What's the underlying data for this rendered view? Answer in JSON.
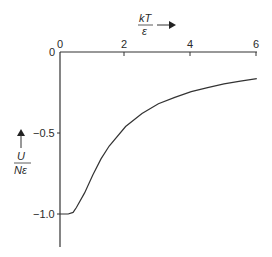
{
  "chart_data": {
    "type": "line",
    "title": "",
    "xlabel": "kT/ε",
    "ylabel": "U/Nε",
    "xlabel_num": "kT",
    "xlabel_den": "ε",
    "ylabel_num": "U",
    "ylabel_den": "Nε",
    "xlim": [
      0,
      6
    ],
    "ylim": [
      -1.2,
      0
    ],
    "x_ticks": [
      "0",
      "2",
      "4",
      "6"
    ],
    "y_ticks": [
      "0",
      "-0.5",
      "-1.0"
    ],
    "y_tick_labels": [
      "0",
      "−0.5",
      "−1.0"
    ],
    "grid": false,
    "legend": null,
    "x_axis_position": "top",
    "series": [
      {
        "name": "U/Nε = -tanh(ε/kT)",
        "x": [
          0.0,
          0.25,
          0.4,
          0.5,
          0.75,
          1.0,
          1.25,
          1.5,
          2.0,
          2.5,
          3.0,
          3.5,
          4.0,
          4.5,
          5.0,
          5.5,
          6.0
        ],
        "y": [
          -1.0,
          -1.0,
          -0.99,
          -0.96,
          -0.87,
          -0.76,
          -0.66,
          -0.58,
          -0.46,
          -0.38,
          -0.32,
          -0.28,
          -0.245,
          -0.22,
          -0.197,
          -0.18,
          -0.165
        ]
      }
    ]
  }
}
